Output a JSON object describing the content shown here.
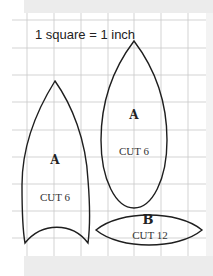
{
  "figure": {
    "scale_label": "1 square = 1 inch",
    "grid": {
      "line_color": "#c8c8c8",
      "vertical_lines_x": [
        27,
        54,
        81,
        108,
        134,
        161,
        188
      ],
      "horizontal_lines_y": [
        20,
        48,
        75,
        102,
        130,
        157,
        184,
        211,
        238
      ]
    },
    "outline_color": "#1e1e1e",
    "pieces": [
      {
        "id": "petal-a-left",
        "letter": "A",
        "cut": "CUT 6"
      },
      {
        "id": "petal-a-right",
        "letter": "A",
        "cut": "CUT 6"
      },
      {
        "id": "lens-b",
        "letter": "B",
        "cut": "CUT 12"
      }
    ]
  }
}
